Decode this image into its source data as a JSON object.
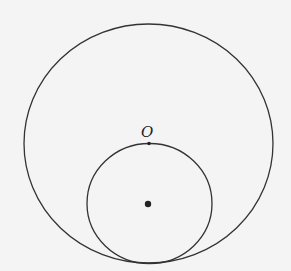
{
  "diagram": {
    "background": "#f4f4f4",
    "stroke_color": "#333333",
    "large_circle": {
      "cx": 148.5,
      "cy": 143.5,
      "rx": 124.5,
      "ry": 119.5
    },
    "small_circle": {
      "cx": 149.5,
      "cy": 203.5,
      "rx": 62.5,
      "ry": 60
    },
    "point_O": {
      "label": "O",
      "x": 149,
      "y": 143
    },
    "center_dot": {
      "x": 148,
      "y": 204
    }
  }
}
